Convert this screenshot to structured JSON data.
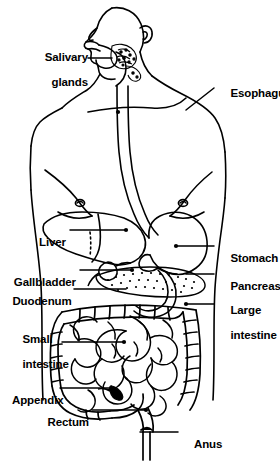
{
  "figure": {
    "kind": "anatomical-line-drawing",
    "background_color": "#ffffff",
    "line_color": "#000000",
    "label_color": "#000000"
  },
  "labels": [
    {
      "id": "salivary-glands",
      "line1": "Salivary",
      "line2": "glands",
      "side": "left",
      "text_x": 22,
      "text_y": 38,
      "leader": [
        [
          88,
          58
        ],
        [
          112,
          58
        ]
      ],
      "dot": null
    },
    {
      "id": "esophagus",
      "line1": "Esophagus",
      "line2": "",
      "side": "right",
      "text_x": 218,
      "text_y": 81,
      "leader": [
        [
          214,
          88
        ],
        [
          186,
          110
        ]
      ],
      "dot": null
    },
    {
      "id": "liver",
      "line1": "Liver",
      "line2": "",
      "side": "left",
      "text_x": 34,
      "text_y": 222,
      "leader": [
        [
          70,
          230
        ],
        [
          126,
          230
        ]
      ],
      "dot": [
        126,
        230
      ]
    },
    {
      "id": "stomach",
      "line1": "Stomach",
      "line2": "",
      "side": "right",
      "text_x": 218,
      "text_y": 239,
      "leader": [
        [
          214,
          246
        ],
        [
          176,
          246
        ]
      ],
      "dot": [
        176,
        246
      ]
    },
    {
      "id": "gallbladder",
      "line1": "Gallbladder",
      "line2": "",
      "side": "left",
      "text_x": 6,
      "text_y": 262,
      "leader": [
        [
          80,
          270
        ],
        [
          132,
          270
        ]
      ],
      "dot": [
        132,
        270
      ]
    },
    {
      "id": "pancreas",
      "line1": "Pancreas",
      "line2": "",
      "side": "right",
      "text_x": 218,
      "text_y": 267,
      "leader": [
        [
          214,
          274
        ],
        [
          186,
          274
        ]
      ],
      "dot": null
    },
    {
      "id": "duodenum",
      "line1": "Duodenum",
      "line2": "",
      "side": "left",
      "text_x": 6,
      "text_y": 281,
      "leader": [
        [
          74,
          289
        ],
        [
          126,
          289
        ]
      ],
      "dot": null
    },
    {
      "id": "large-intestine",
      "line1": "Large",
      "line2": "intestine",
      "side": "right",
      "text_x": 218,
      "text_y": 291,
      "leader": [
        [
          214,
          304
        ],
        [
          186,
          304
        ]
      ],
      "dot": [
        186,
        304
      ]
    },
    {
      "id": "small-intestine",
      "line1": "Small",
      "line2": "intestine",
      "side": "left",
      "text_x": 10,
      "text_y": 320,
      "leader": [
        [
          62,
          342
        ],
        [
          124,
          342
        ]
      ],
      "dot": [
        124,
        342
      ]
    },
    {
      "id": "appendix",
      "line1": "Appendix",
      "line2": "",
      "side": "left",
      "text_x": 6,
      "text_y": 380,
      "leader": [
        [
          60,
          388
        ],
        [
          116,
          388
        ]
      ],
      "dot": null
    },
    {
      "id": "rectum",
      "line1": "Rectum",
      "line2": "",
      "side": "left",
      "text_x": 40,
      "text_y": 402,
      "leader": [
        [
          92,
          410
        ],
        [
          146,
          410
        ]
      ],
      "dot": [
        146,
        410
      ]
    },
    {
      "id": "anus",
      "line1": "Anus",
      "line2": "",
      "side": "right",
      "text_x": 182,
      "text_y": 425,
      "leader": [
        [
          178,
          432
        ],
        [
          140,
          432
        ]
      ],
      "dot": null
    }
  ],
  "organs": [
    "salivary glands",
    "esophagus",
    "liver",
    "stomach",
    "gallbladder",
    "pancreas",
    "duodenum",
    "large intestine",
    "small intestine",
    "appendix",
    "rectum",
    "anus"
  ]
}
